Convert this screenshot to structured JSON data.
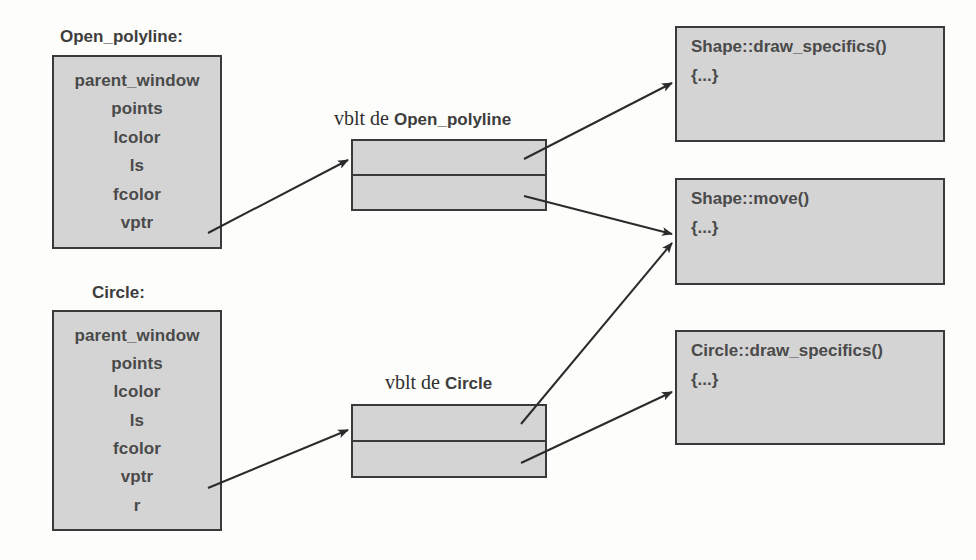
{
  "diagram": {
    "title_left_1": "Open_polyline:",
    "title_left_2": "Circle:",
    "vtable_1_prefix": "vblt de ",
    "vtable_1_name": "Open_polyline",
    "vtable_2_prefix": "vblt de ",
    "vtable_2_name": "Circle",
    "colors": {
      "box_fill": "#d4d4d4",
      "box_border": "#3a3a3a",
      "text": "#4a4a4a",
      "background": "#fdfdfc",
      "arrow": "#2b2b2b"
    }
  },
  "objects": [
    {
      "name": "Open_polyline:",
      "fields": [
        "parent_window",
        "points",
        "lcolor",
        "ls",
        "fcolor",
        "vptr"
      ]
    },
    {
      "name": "Circle:",
      "fields": [
        "parent_window",
        "points",
        "lcolor",
        "ls",
        "fcolor",
        "vptr",
        "r"
      ]
    }
  ],
  "vtables": [
    {
      "label_prefix": "vblt de ",
      "label_name": "Open_polyline",
      "slots": [
        "",
        ""
      ]
    },
    {
      "label_prefix": "vblt de ",
      "label_name": "Circle",
      "slots": [
        "",
        ""
      ]
    }
  ],
  "functions": [
    {
      "signature": "Shape::draw_specifics()",
      "body": "{...}"
    },
    {
      "signature": "Shape::move()",
      "body": "{...}"
    },
    {
      "signature": "Circle::draw_specifics()",
      "body": "{...}"
    }
  ],
  "arrows": [
    {
      "from": "open-polyline-vptr",
      "to": "vtable-open-polyline"
    },
    {
      "from": "vtable-open-polyline-slot-0",
      "to": "fn-shape-draw-specifics"
    },
    {
      "from": "vtable-open-polyline-slot-1",
      "to": "fn-shape-move"
    },
    {
      "from": "circle-vptr",
      "to": "vtable-circle"
    },
    {
      "from": "vtable-circle-slot-0",
      "to": "fn-shape-move"
    },
    {
      "from": "vtable-circle-slot-1",
      "to": "fn-circle-draw-specifics"
    }
  ]
}
